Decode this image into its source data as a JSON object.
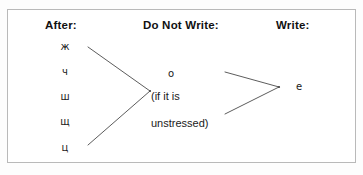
{
  "figure": {
    "background_color": "#ffffff",
    "border_color": "#b9b9b9",
    "line_color": "#4a4a4a",
    "text_color": "#1a1a1a"
  },
  "headers": {
    "left": "After:",
    "middle": "Do Not Write:",
    "right": "Write:"
  },
  "left_column": {
    "letters": [
      {
        "char": "ж",
        "x": 55,
        "y": 41
      },
      {
        "char": "ч",
        "x": 55,
        "y": 66
      },
      {
        "char": "ш",
        "x": 55,
        "y": 91
      },
      {
        "char": "щ",
        "x": 55,
        "y": 116
      },
      {
        "char": "ц",
        "x": 55,
        "y": 142
      }
    ]
  },
  "middle_column": {
    "letter": "о",
    "condition_line_1": "(if it is",
    "condition_line_2": "unstressed)"
  },
  "right_column": {
    "letter": "е"
  },
  "connectors": {
    "left_bracket": {
      "top_start_x": 88,
      "top_start_y": 47,
      "vertex_x": 150,
      "vertex_y": 91,
      "bottom_start_x": 88,
      "bottom_start_y": 145
    },
    "right_bracket": {
      "top_start_x": 225,
      "top_start_y": 72,
      "vertex_x": 279,
      "vertex_y": 87,
      "bottom_start_x": 225,
      "bottom_start_y": 114
    }
  }
}
